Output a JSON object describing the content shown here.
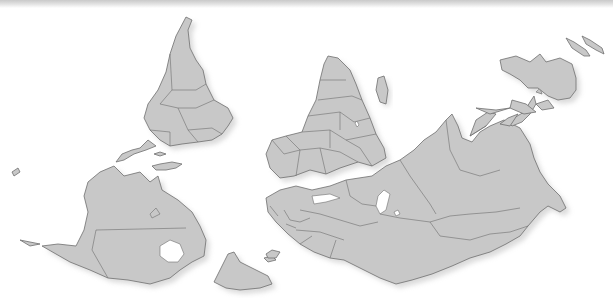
{
  "map": {
    "projection": "south-up world map",
    "colors": {
      "land": "#c8c8c8",
      "border": "#6e6e6e",
      "ocean": "#ffffff"
    },
    "regions": [
      {
        "name": "South America"
      },
      {
        "name": "North America"
      },
      {
        "name": "Greenland"
      },
      {
        "name": "Africa"
      },
      {
        "name": "Madagascar"
      },
      {
        "name": "Europe"
      },
      {
        "name": "Asia"
      },
      {
        "name": "Australia"
      },
      {
        "name": "New Zealand"
      },
      {
        "name": "Southeast Asia"
      },
      {
        "name": "Japan"
      }
    ]
  }
}
